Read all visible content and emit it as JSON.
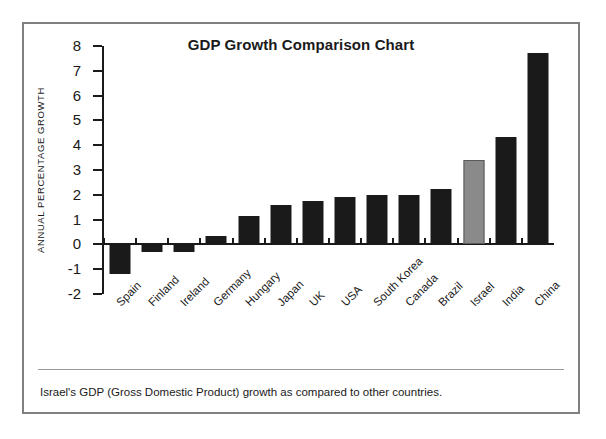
{
  "figure": {
    "title": "GDP Growth Comparison Chart",
    "caption": "Israel's GDP (Gross Domestic Product) growth as compared to other countries.",
    "border_color": "#808080",
    "background": "#ffffff"
  },
  "chart_data": {
    "type": "bar",
    "title": "GDP Growth Comparison Chart",
    "xlabel": "",
    "ylabel": "ANNUAL PERCENTAGE GROWTH",
    "ylim": [
      -2,
      8
    ],
    "yticks": [
      8,
      7,
      6,
      5,
      4,
      3,
      2,
      1,
      0,
      -1,
      -2
    ],
    "grid": false,
    "legend": "none",
    "highlight_category": "Israel",
    "bar_color": "#1a1a1a",
    "highlight_color": "#8a8a8a",
    "categories": [
      "Spain",
      "Finland",
      "Ireland",
      "Germany",
      "Hungary",
      "Japan",
      "UK",
      "USA",
      "South Korea",
      "Canada",
      "Brazil",
      "Israel",
      "India",
      "China"
    ],
    "values": [
      -1.2,
      -0.3,
      -0.3,
      0.35,
      1.15,
      1.6,
      1.75,
      1.9,
      2.0,
      2.0,
      2.25,
      3.4,
      4.35,
      7.7
    ]
  }
}
